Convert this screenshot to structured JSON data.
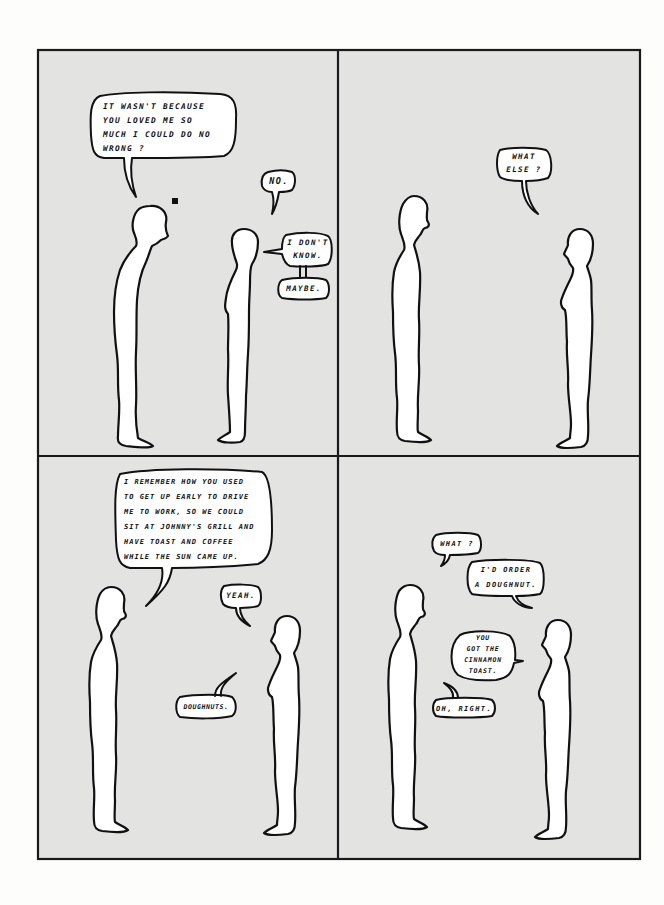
{
  "comic": {
    "colors": {
      "page_background": "#fdfdfc",
      "panel_background": "#e3e3e2",
      "ink": "#111111",
      "figure_fill": "#ffffff"
    },
    "panels": [
      {
        "id": 1,
        "bubbles": [
          {
            "speaker": "man",
            "text": "IT WASN'T BECAUSE\nYOU LOVED ME SO\nMUCH I COULD DO NO\nWRONG ?"
          },
          {
            "speaker": "woman",
            "text": "NO."
          },
          {
            "speaker": "woman",
            "text": "I DON'T\nKNOW."
          },
          {
            "speaker": "woman",
            "text": "MAYBE."
          }
        ]
      },
      {
        "id": 2,
        "bubbles": [
          {
            "speaker": "woman",
            "text": "WHAT\nELSE ?"
          }
        ]
      },
      {
        "id": 3,
        "bubbles": [
          {
            "speaker": "man",
            "text": "I REMEMBER HOW YOU USED\nTO GET UP EARLY TO DRIVE\nME TO WORK, SO WE COULD\nSIT AT JOHNNY'S GRILL AND\nHAVE TOAST AND COFFEE\nWHILE THE SUN CAME UP."
          },
          {
            "speaker": "woman",
            "text": "YEAH."
          },
          {
            "speaker": "woman",
            "text": "DOUGHNUTS."
          }
        ]
      },
      {
        "id": 4,
        "bubbles": [
          {
            "speaker": "man",
            "text": "WHAT ?"
          },
          {
            "speaker": "woman",
            "text": "I'D ORDER\nA DOUGHNUT."
          },
          {
            "speaker": "man",
            "text": "YOU\nGOT THE\nCINNAMON\nTOAST."
          },
          {
            "speaker": "man",
            "text": "OH, RIGHT."
          }
        ]
      }
    ]
  }
}
